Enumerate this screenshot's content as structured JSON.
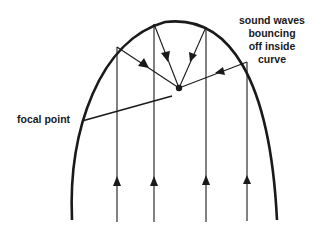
{
  "diagram": {
    "labels": {
      "sound_waves_line1": "sound waves",
      "sound_waves_line2": "bouncing",
      "sound_waves_line3": "off inside",
      "sound_waves_line4": "curve",
      "focal_point": "focal point"
    },
    "colors": {
      "stroke": "#1a1a1a",
      "background": "#ffffff"
    },
    "elements": {
      "reflector_curve": "parabolic curve",
      "incoming_rays_count": 4,
      "reflected_rays_count": 4,
      "focal_point_marker": "filled dot"
    }
  }
}
